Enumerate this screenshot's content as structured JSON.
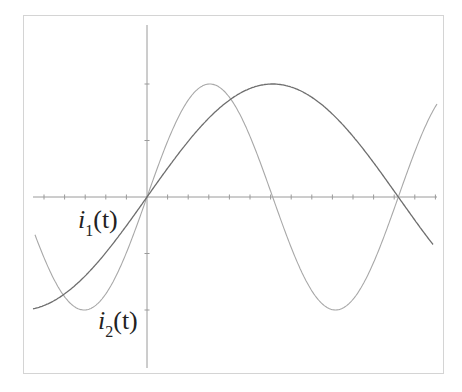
{
  "chart_data": {
    "type": "line",
    "title": "",
    "xlabel": "t",
    "ylabel": "",
    "grid": false,
    "legend": "inline labels",
    "axes": {
      "x_ticks_count_left_of_origin": 5,
      "x_ticks_count_right_of_origin": 14,
      "y_ticks": [
        2,
        1,
        -1,
        -2
      ]
    },
    "series": [
      {
        "name": "i1(t)",
        "label_base": "i",
        "label_sub": "1",
        "label_arg": "(t)",
        "color": "#6e6e6e",
        "amplitude": 2,
        "half_period_ticks": 12.2,
        "description": "sinusoid, zero at origin, peak near tick 6, second zero near tick 12"
      },
      {
        "name": "i2(t)",
        "label_base": "i",
        "label_sub": "2",
        "label_arg": "(t)",
        "color": "#a8a8a8",
        "amplitude": 2,
        "half_period_ticks": 6.1,
        "description": "sinusoid at twice the frequency of i1, zero at origin, peak near tick 3, trough near tick 9"
      }
    ],
    "x": [
      -5.5,
      -4,
      -2,
      0,
      2,
      3,
      4,
      6,
      8,
      9,
      10,
      12,
      14
    ],
    "values_i1": [
      -2.0,
      -1.0,
      -0.5,
      0,
      0.9,
      1.3,
      1.6,
      2.0,
      1.7,
      1.3,
      0.9,
      0,
      -0.9
    ],
    "values_i2": [
      -0.7,
      -1.8,
      -1.5,
      0,
      1.7,
      2.0,
      1.7,
      0,
      -1.7,
      -2.0,
      -1.7,
      0,
      1.7
    ]
  },
  "labels": {
    "i1": {
      "base": "i",
      "sub": "1",
      "arg": "(t)"
    },
    "i2": {
      "base": "i",
      "sub": "2",
      "arg": "(t)"
    }
  }
}
